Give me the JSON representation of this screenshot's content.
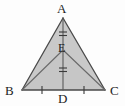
{
  "figure": {
    "kind": "geometry-diagram",
    "labels": {
      "A": "A",
      "B": "B",
      "C": "C",
      "D": "D",
      "E": "E"
    },
    "points": {
      "A": {
        "x": 63,
        "y": 18
      },
      "B": {
        "x": 22,
        "y": 90
      },
      "C": {
        "x": 105,
        "y": 90
      },
      "D": {
        "x": 63,
        "y": 90
      },
      "E": {
        "x": 63,
        "y": 50
      }
    },
    "segments": [
      {
        "name": "AB",
        "from": "A",
        "to": "B"
      },
      {
        "name": "AC",
        "from": "A",
        "to": "C"
      },
      {
        "name": "BC",
        "from": "B",
        "to": "C"
      },
      {
        "name": "AD",
        "from": "A",
        "to": "D"
      },
      {
        "name": "BE",
        "from": "B",
        "to": "E"
      },
      {
        "name": "EC",
        "from": "E",
        "to": "C"
      }
    ],
    "tick_marks": [
      {
        "on": "AE",
        "count": 2,
        "orientation": "horizontal",
        "x": 63,
        "y": 34
      },
      {
        "on": "ED",
        "count": 2,
        "orientation": "horizontal",
        "x": 63,
        "y": 70
      },
      {
        "on": "BD",
        "count": 1,
        "orientation": "vertical",
        "x": 42,
        "y": 90
      },
      {
        "on": "DC",
        "count": 1,
        "orientation": "vertical",
        "x": 84,
        "y": 90
      }
    ],
    "colors": {
      "fill": "#c9c9c9",
      "stroke": "#4a4a4a",
      "label": "#1c1c1c",
      "background": "#fdfdfd"
    }
  }
}
